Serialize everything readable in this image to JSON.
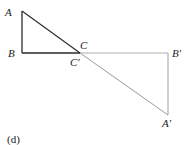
{
  "diagram": {
    "caption": "(d)",
    "labels": {
      "A": "A",
      "B": "B",
      "C": "C",
      "C_prime": "C′",
      "B_prime": "B′",
      "A_prime": "A′"
    },
    "colors": {
      "original_triangle": "#2a2a2a",
      "image_triangle": "#b0b0b0"
    }
  }
}
